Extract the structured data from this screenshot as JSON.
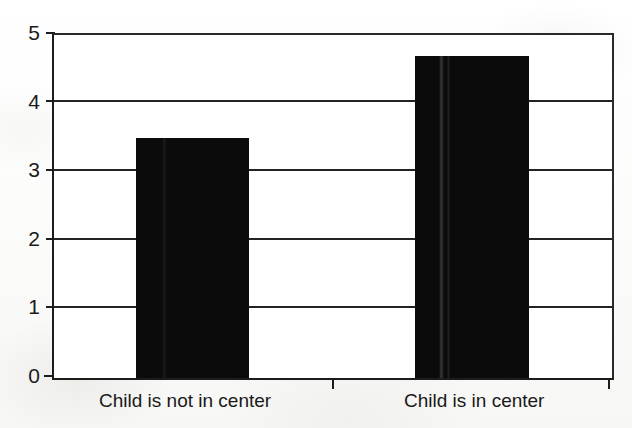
{
  "chart_data": {
    "type": "bar",
    "title": "",
    "subtitle": "",
    "xlabel": "",
    "ylabel": "",
    "categories": [
      "Child is not in center",
      "Child is in center"
    ],
    "values": [
      3.5,
      4.7
    ],
    "series": [
      {
        "name": "",
        "values": [
          3.5,
          4.7
        ]
      }
    ],
    "ylim": [
      0,
      5
    ],
    "yticks": [
      0,
      1,
      2,
      3,
      4,
      5
    ],
    "ytick_labels": [
      "0",
      "1",
      "2",
      "3",
      "4",
      "5"
    ],
    "grid": "horizontal",
    "legend": "none",
    "bar_color": "#0b0b0b",
    "axis_color": "#1c1c1c",
    "background_color": "#ffffff",
    "annotations": []
  },
  "axis": {
    "y_labels": [
      "5",
      "4",
      "3",
      "2",
      "1",
      "0"
    ]
  },
  "categories": {
    "first": "Child is not in center",
    "second": "Child is in center"
  }
}
